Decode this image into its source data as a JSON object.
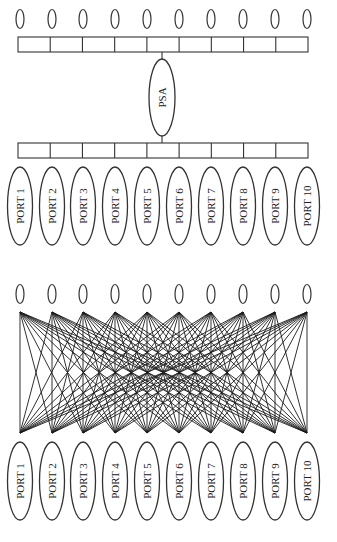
{
  "colors": {
    "stroke": "#333333",
    "mesh_stroke": "#1a1a1a",
    "background": "#ffffff",
    "text": "#222222"
  },
  "layout": {
    "node_x": [
      20,
      52,
      83,
      115,
      147,
      179,
      211,
      243,
      275,
      307
    ],
    "top_section": {
      "small_nodes_cy": 19,
      "bar_y": 37,
      "bar_h": 15,
      "bar_x0": 18,
      "bar_x1": 308,
      "bar_cells": 9,
      "psa": {
        "cx": 162,
        "cy": 97.5,
        "rx": 13,
        "ry": 38.5
      },
      "bar2_y": 143,
      "bar2_h": 15,
      "ports_cy": 206,
      "port_rx": 12.5,
      "port_ry": 39
    },
    "bottom_section": {
      "small_nodes_cy": 294,
      "mesh_top_y": 312,
      "mesh_bottom_y": 433,
      "ports_cy": 481,
      "port_rx": 12.5,
      "port_ry": 39
    },
    "small_node_rx": 4,
    "small_node_ry": 9.5
  },
  "top_diagram": {
    "title": "Centralized PSA topology",
    "hub_label": "PSA",
    "small_node_count": 10,
    "ports": [
      "PORT 1",
      "PORT 2",
      "PORT 3",
      "PORT 4",
      "PORT 5",
      "PORT 6",
      "PORT 7",
      "PORT 8",
      "PORT 9",
      "PORT 10"
    ]
  },
  "bottom_diagram": {
    "title": "Fully connected mesh topology",
    "small_node_count": 10,
    "ports": [
      "PORT 1",
      "PORT 2",
      "PORT 3",
      "PORT 4",
      "PORT 5",
      "PORT 6",
      "PORT 7",
      "PORT 8",
      "PORT 9",
      "PORT 10"
    ]
  }
}
